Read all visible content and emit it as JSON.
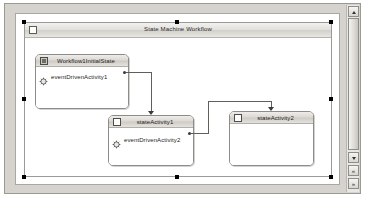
{
  "window": {
    "background_color": "#d6d3ce",
    "surface_color": "#ffffff"
  },
  "designer": {
    "root": {
      "title": "State Machine Workflow",
      "icon": "state-machine-workflow-icon"
    },
    "states": [
      {
        "id": "workflow1-initial-state",
        "title": "Workflow1InitialState",
        "icon": "initial-state-icon",
        "activities": [
          {
            "id": "event-driven-activity-1",
            "label": "eventDrivenActivity1",
            "icon": "event-driven-activity-icon"
          }
        ]
      },
      {
        "id": "state-activity-1",
        "title": "stateActivity1",
        "icon": "state-activity-icon",
        "activities": [
          {
            "id": "event-driven-activity-2",
            "label": "eventDrivenActivity2",
            "icon": "event-driven-activity-icon"
          }
        ]
      },
      {
        "id": "state-activity-2",
        "title": "stateActivity2",
        "icon": "state-activity-icon",
        "activities": []
      }
    ],
    "connectors": [
      {
        "id": "connector-1",
        "from": "eventDrivenActivity1",
        "to": "stateActivity1",
        "color": "#5f5f5a"
      },
      {
        "id": "connector-2",
        "from": "eventDrivenActivity2",
        "to": "stateActivity2",
        "color": "#5f5f5a"
      }
    ],
    "selection_handle_color": "#000000"
  },
  "scrollbar": {
    "up_arrow": "scroll-up-icon",
    "down_arrow": "scroll-down-icon",
    "nav_prev": "nav-previous-icon",
    "nav_next": "nav-next-icon",
    "prev_glyph": "«",
    "next_glyph": "»"
  }
}
